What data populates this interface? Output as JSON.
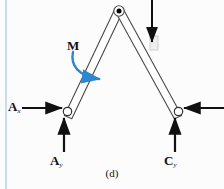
{
  "figure": {
    "caption": "(d)",
    "background_color": "#fcfcfc",
    "margin_rule_color": "#c6dcef"
  },
  "labels": {
    "ax": {
      "base": "A",
      "sub": "x"
    },
    "ay": {
      "base": "A",
      "sub": "y"
    },
    "cy": {
      "base": "C",
      "sub": "y"
    },
    "moment": {
      "base": "M",
      "sub": ""
    }
  },
  "colors": {
    "member_stroke": "#4a4a4a",
    "force_arrow": "#111111",
    "moment_arrow": "#2e86d0",
    "pin_fill": "#ffffff",
    "apex_pin_fill": "#000000",
    "ghost_box": "#cfcfcf"
  },
  "geometry": {
    "apex": {
      "x": 119,
      "y": 11
    },
    "pin_a": {
      "x": 68,
      "y": 112
    },
    "pin_c": {
      "x": 178,
      "y": 112
    },
    "member_half_width": 4
  },
  "forces": [
    {
      "name": "Ax",
      "label": "A",
      "sub": "x",
      "direction": "right",
      "from": {
        "x": 22,
        "y": 108
      },
      "to": {
        "x": 63,
        "y": 108
      }
    },
    {
      "name": "Ay",
      "label": "A",
      "sub": "y",
      "direction": "up",
      "from": {
        "x": 64,
        "y": 152
      },
      "to": {
        "x": 64,
        "y": 117
      }
    },
    {
      "name": "Cy",
      "label": "C",
      "sub": "y",
      "direction": "up",
      "from": {
        "x": 175,
        "y": 152
      },
      "to": {
        "x": 175,
        "y": 117
      }
    },
    {
      "name": "Cx",
      "label": "",
      "sub": "",
      "direction": "left",
      "from": {
        "x": 224,
        "y": 108
      },
      "to": {
        "x": 183,
        "y": 108
      }
    },
    {
      "name": "P",
      "label": "",
      "sub": "",
      "direction": "down",
      "from": {
        "x": 152,
        "y": 0
      },
      "to": {
        "x": 152,
        "y": 43
      }
    }
  ],
  "moment": {
    "name": "M",
    "sense": "clockwise",
    "arc_start": {
      "x": 73,
      "y": 52
    },
    "arc_end": {
      "x": 102,
      "y": 78
    }
  }
}
